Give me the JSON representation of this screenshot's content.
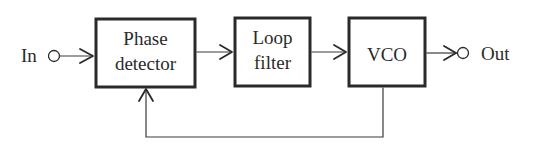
{
  "diagram": {
    "input": {
      "label": "In"
    },
    "output": {
      "label": "Out"
    },
    "blocks": [
      {
        "id": "phase-detector",
        "line1": "Phase",
        "line2": "detector"
      },
      {
        "id": "loop-filter",
        "line1": "Loop",
        "line2": "filter"
      },
      {
        "id": "vco",
        "line1": "VCO"
      }
    ],
    "connections": [
      {
        "from": "In",
        "to": "phase-detector"
      },
      {
        "from": "phase-detector",
        "to": "loop-filter"
      },
      {
        "from": "loop-filter",
        "to": "vco"
      },
      {
        "from": "vco",
        "to": "Out"
      },
      {
        "from": "vco",
        "to": "phase-detector",
        "type": "feedback"
      }
    ],
    "colors": {
      "ink": "#2a2a2a",
      "background": "#ffffff"
    }
  }
}
